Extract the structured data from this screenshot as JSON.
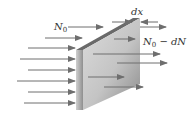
{
  "diagram": {
    "title": "",
    "labels": {
      "incident": "N",
      "incident_sub": "0",
      "thickness": "dx",
      "transmitted_main": "N",
      "transmitted_sub": "0",
      "transmitted_rest": " − dN"
    },
    "colors": {
      "arrow": "#6e6e6e",
      "slab_front_light": "#e6e6e6",
      "slab_front_dark": "#8c8c8c",
      "slab_edge": "#7a7a7a",
      "slab_top": "#6a6a6a",
      "text": "#333333"
    },
    "incoming_arrows": [
      {
        "x1": 45,
        "x2": 82,
        "y": 38
      },
      {
        "x1": 28,
        "x2": 75,
        "y": 48
      },
      {
        "x1": 20,
        "x2": 75,
        "y": 59
      },
      {
        "x1": 28,
        "x2": 75,
        "y": 70
      },
      {
        "x1": 17,
        "x2": 75,
        "y": 81
      },
      {
        "x1": 28,
        "x2": 75,
        "y": 92
      },
      {
        "x1": 24,
        "x2": 75,
        "y": 103
      }
    ],
    "outgoing_arrows": [
      {
        "x1": 140,
        "x2": 166,
        "y": 27
      },
      {
        "x1": 114,
        "x2": 135,
        "y": 39
      },
      {
        "x1": 93,
        "x2": 160,
        "y": 54
      },
      {
        "x1": 117,
        "x2": 167,
        "y": 63
      },
      {
        "x1": 88,
        "x2": 124,
        "y": 77
      },
      {
        "x1": 104,
        "x2": 143,
        "y": 87
      }
    ]
  }
}
